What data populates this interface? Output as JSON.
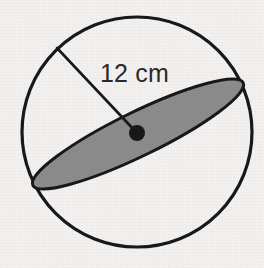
{
  "figure": {
    "kind": "sphere-cross-section-diagram",
    "background_color": "#f3f2f0",
    "stroke_color": "#18181a",
    "shading_color": "#8c8c8c",
    "label_color": "#2a2a2a",
    "sphere": {
      "name": "sphere-outline",
      "center_x": 137,
      "center_y": 132,
      "radius": 115,
      "stroke_width": 3.2
    },
    "cross_section": {
      "name": "shaded-great-circle",
      "center_x": 138,
      "center_y": 134,
      "semi_major": 117,
      "semi_minor": 22,
      "rotation_deg": -26,
      "fill": "#8c8c8c",
      "stroke_width": 3.0
    },
    "center_point": {
      "name": "sphere-center-dot",
      "x": 137,
      "y": 133,
      "radius": 8
    },
    "radius_line": {
      "name": "radius-segment",
      "x1": 57,
      "y1": 48,
      "x2": 137,
      "y2": 133,
      "stroke_width": 2.6
    },
    "label": {
      "text": "12 cm",
      "value": "12",
      "unit": "cm",
      "x": 100,
      "y": 82,
      "font_size": 25
    }
  }
}
